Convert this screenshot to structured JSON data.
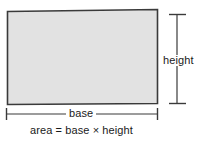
{
  "diagram": {
    "shape": {
      "name": "rectangle",
      "fill_color": "#e2e2e2",
      "stroke_color": "#3a3a3a"
    },
    "background_color": "#ffffff",
    "text_color": "#1a1a1a"
  },
  "labels": {
    "base": "base",
    "height": "height",
    "formula": "area = base × height"
  },
  "dimensions": {
    "base_line": {
      "orientation": "horizontal",
      "x_start": 6,
      "x_end": 157,
      "y": 114
    },
    "height_line": {
      "orientation": "vertical",
      "x": 177,
      "y_start": 14,
      "y_end": 104
    }
  }
}
